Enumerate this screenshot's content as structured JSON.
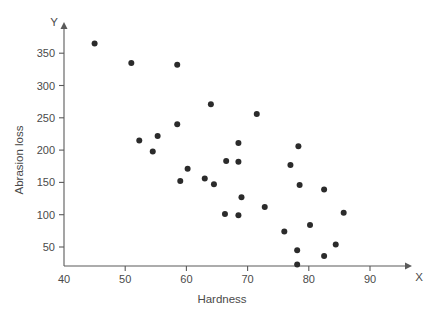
{
  "chart_data": {
    "type": "scatter",
    "title": "",
    "xlabel": "Hardness",
    "ylabel": "Abrasion loss",
    "x_axis_letter": "X",
    "y_axis_letter": "Y",
    "xlim": [
      40,
      93
    ],
    "ylim": [
      0,
      385
    ],
    "xticks": [
      40,
      50,
      60,
      70,
      80,
      90
    ],
    "yticks": [
      50,
      100,
      150,
      200,
      250,
      300,
      350
    ],
    "xtick_labels": [
      "40",
      "50",
      "60",
      "70",
      "80",
      "90"
    ],
    "ytick_labels": [
      "50",
      "100",
      "150",
      "200",
      "250",
      "300",
      "350"
    ],
    "grid": false,
    "legend": false,
    "marker": "filled-circle",
    "marker_color": "#2b2b2b",
    "marker_size_px": 3,
    "axis_color": "#5a5a5a",
    "text_color": "#4a4a4a",
    "background": "#ffffff",
    "points": [
      {
        "x": 45,
        "y": 365
      },
      {
        "x": 51,
        "y": 335
      },
      {
        "x": 58.5,
        "y": 332
      },
      {
        "x": 64,
        "y": 271
      },
      {
        "x": 71.5,
        "y": 256
      },
      {
        "x": 58.5,
        "y": 240
      },
      {
        "x": 55.3,
        "y": 222
      },
      {
        "x": 52.3,
        "y": 215
      },
      {
        "x": 68.5,
        "y": 211
      },
      {
        "x": 54.5,
        "y": 198
      },
      {
        "x": 78.3,
        "y": 206
      },
      {
        "x": 66.5,
        "y": 183
      },
      {
        "x": 68.5,
        "y": 182
      },
      {
        "x": 77,
        "y": 177
      },
      {
        "x": 60.2,
        "y": 171
      },
      {
        "x": 63,
        "y": 156
      },
      {
        "x": 59,
        "y": 152
      },
      {
        "x": 64.5,
        "y": 147
      },
      {
        "x": 78.5,
        "y": 146
      },
      {
        "x": 82.5,
        "y": 139
      },
      {
        "x": 69,
        "y": 127
      },
      {
        "x": 72.8,
        "y": 112
      },
      {
        "x": 85.7,
        "y": 103
      },
      {
        "x": 66.3,
        "y": 101
      },
      {
        "x": 68.5,
        "y": 99
      },
      {
        "x": 80.2,
        "y": 84
      },
      {
        "x": 76,
        "y": 74
      },
      {
        "x": 84.4,
        "y": 54
      },
      {
        "x": 78.1,
        "y": 45
      },
      {
        "x": 82.5,
        "y": 36
      },
      {
        "x": 78.1,
        "y": 23
      }
    ]
  }
}
